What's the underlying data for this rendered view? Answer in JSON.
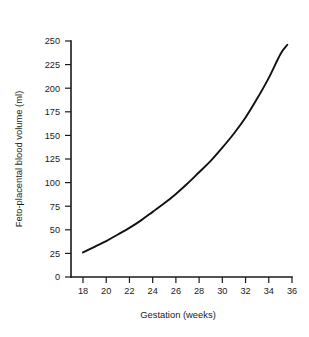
{
  "chart_data": {
    "type": "line",
    "title": "",
    "xlabel": "Gestation (weeks)",
    "ylabel": "Feto-placental blood volume (ml)",
    "xlim": [
      17,
      36.6
    ],
    "ylim": [
      0,
      255
    ],
    "xticks": [
      18,
      20,
      22,
      24,
      26,
      28,
      30,
      32,
      34,
      36
    ],
    "xticklabels": [
      "18",
      "20",
      "22",
      "24",
      "26",
      "28",
      "30",
      "32",
      "34",
      "36"
    ],
    "yticks": [
      0,
      25,
      50,
      75,
      100,
      125,
      150,
      175,
      200,
      225,
      250
    ],
    "yticklabels": [
      "0",
      "25",
      "50",
      "75",
      "100",
      "125",
      "150",
      "175",
      "200",
      "225",
      "250"
    ],
    "grid": false,
    "legend": false,
    "legend_position": "none",
    "series": [
      {
        "name": "Feto-placental blood volume",
        "color": "#111111",
        "x": [
          18,
          19,
          20,
          21,
          22,
          23,
          24,
          25,
          26,
          27,
          28,
          29,
          30,
          31,
          32,
          33,
          34,
          35,
          35.6
        ],
        "values": [
          26,
          32,
          38,
          45,
          52,
          60,
          69,
          78,
          88,
          99,
          111,
          123,
          137,
          152,
          169,
          189,
          211,
          236,
          246
        ]
      }
    ],
    "annotations": []
  },
  "axes": {
    "y_axis_name": "y-axis",
    "x_axis_name": "x-axis"
  }
}
